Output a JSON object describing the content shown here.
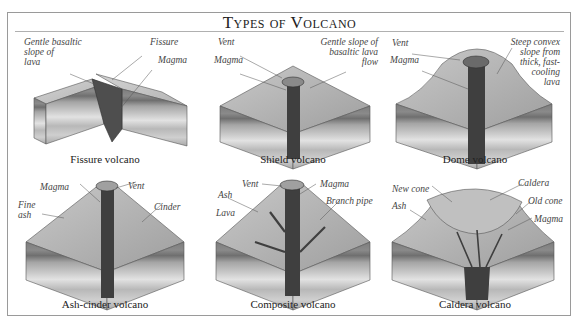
{
  "title": "Types of Volcano",
  "panels": [
    {
      "caption": "Fissure volcano",
      "labels": [
        "Gentle basaltic\nslope of\nlava",
        "Fissure",
        "Magma"
      ]
    },
    {
      "caption": "Shield volcano",
      "labels": [
        "Vent",
        "Magma",
        "Gentle slope of\nbasaltic lava\nflow"
      ]
    },
    {
      "caption": "Dome volcano",
      "labels": [
        "Vent",
        "Magma",
        "Steep convex\nslope from\nthick, fast-\ncooling\nlava"
      ]
    },
    {
      "caption": "Ash-cinder volcano",
      "labels": [
        "Magma",
        "Vent",
        "Fine\nash",
        "Cinder"
      ]
    },
    {
      "caption": "Composite volcano",
      "labels": [
        "Vent",
        "Magma",
        "Ash",
        "Branch pipe",
        "Lava"
      ]
    },
    {
      "caption": "Caldera volcano",
      "labels": [
        "New cone",
        "Caldera",
        "Ash",
        "Old cone",
        "Magma"
      ]
    }
  ]
}
